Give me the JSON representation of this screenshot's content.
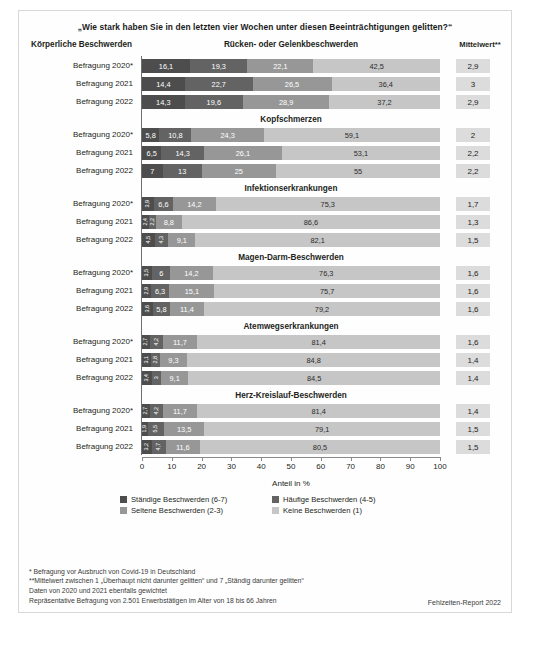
{
  "title": "„Wie stark haben Sie in den letzten vier Wochen unter diesen Beeinträchtigungen gelitten?“",
  "header": {
    "left": "Körperliche Beschwerden",
    "mean_col": "Mittelwert**"
  },
  "axis": {
    "caption": "Anteil in %",
    "ticks": [
      0,
      10,
      20,
      30,
      40,
      50,
      60,
      70,
      80,
      90,
      100
    ],
    "min": 0,
    "max": 100
  },
  "legend": [
    {
      "label": "Ständige Beschwerden (6-7)",
      "color": "#4d4d4d"
    },
    {
      "label": "Häufige Beschwerden (4-5)",
      "color": "#636363"
    },
    {
      "label": "Seltene Beschwerden (2-3)",
      "color": "#979797"
    },
    {
      "label": "Keine Beschwerden (1)",
      "color": "#c6c6c6"
    }
  ],
  "notes": [
    "*  Befragung vor Ausbruch von Covid-19 in Deutschland",
    "**Mittelwert zwischen 1 „Überhaupt nicht darunter gelitten“ und 7 „Ständig darunter gelitten“",
    "Daten von 2020 und 2021 ebenfalls gewichtet",
    "Repräsentative Befragung von 2.501 Erwerbstätigen im Alter von 18 bis 66 Jahren"
  ],
  "source": "Fehlzeiten-Report 2022",
  "chart_data": {
    "type": "bar",
    "orientation": "horizontal",
    "stacked": true,
    "percent": true,
    "title": "„Wie stark haben Sie in den letzten vier Wochen unter diesen Beeinträchtigungen gelitten?“",
    "xlabel": "Anteil in %",
    "ylabel": "Körperliche Beschwerden",
    "xlim": [
      0,
      100
    ],
    "grid": false,
    "legend_position": "bottom",
    "series": [
      {
        "name": "Ständige Beschwerden (6-7)",
        "color": "#4d4d4d"
      },
      {
        "name": "Häufige Beschwerden (4-5)",
        "color": "#636363"
      },
      {
        "name": "Seltene Beschwerden (2-3)",
        "color": "#979797"
      },
      {
        "name": "Keine Beschwerden (1)",
        "color": "#c6c6c6"
      }
    ],
    "groups": [
      {
        "name": "Rücken- oder Gelenkbeschwerden",
        "rows": [
          {
            "category": "Befragung 2020*",
            "values": [
              16.1,
              19.3,
              22.1,
              42.5
            ],
            "labels": [
              "16,1",
              "19,3",
              "22,1",
              "42,5"
            ],
            "mean": "2,9"
          },
          {
            "category": "Befragung 2021",
            "values": [
              14.4,
              22.7,
              26.5,
              36.4
            ],
            "labels": [
              "14,4",
              "22,7",
              "26,5",
              "36,4"
            ],
            "mean": "3"
          },
          {
            "category": "Befragung 2022",
            "values": [
              14.3,
              19.6,
              28.9,
              37.2
            ],
            "labels": [
              "14,3",
              "19,6",
              "28,9",
              "37,2"
            ],
            "mean": "2,9"
          }
        ]
      },
      {
        "name": "Kopfschmerzen",
        "rows": [
          {
            "category": "Befragung 2020*",
            "values": [
              5.8,
              10.8,
              24.3,
              59.1
            ],
            "labels": [
              "5,8",
              "10,8",
              "24,3",
              "59,1"
            ],
            "mean": "2"
          },
          {
            "category": "Befragung 2021",
            "values": [
              6.5,
              14.3,
              26.1,
              53.1
            ],
            "labels": [
              "6,5",
              "14,3",
              "26,1",
              "53,1"
            ],
            "mean": "2,2"
          },
          {
            "category": "Befragung 2022",
            "values": [
              7,
              13,
              25,
              55
            ],
            "labels": [
              "7",
              "13",
              "25",
              "55"
            ],
            "mean": "2,2"
          }
        ]
      },
      {
        "name": "Infektionserkrankungen",
        "rows": [
          {
            "category": "Befragung 2020*",
            "values": [
              3.9,
              6.6,
              14.2,
              75.3
            ],
            "labels": [
              "3,9",
              "6,6",
              "14,2",
              "75,3"
            ],
            "mean": "1,7"
          },
          {
            "category": "Befragung 2021",
            "values": [
              2.4,
              2.2,
              8.8,
              86.6
            ],
            "labels": [
              "2,4",
              "2,2",
              "8,8",
              "86,6"
            ],
            "mean": "1,3"
          },
          {
            "category": "Befragung 2022",
            "values": [
              4.5,
              4.3,
              9.1,
              82.1
            ],
            "labels": [
              "4,5",
              "4,3",
              "9,1",
              "82,1"
            ],
            "mean": "1,5"
          }
        ]
      },
      {
        "name": "Magen-Darm-Beschwerden",
        "rows": [
          {
            "category": "Befragung 2020*",
            "values": [
              3.5,
              6,
              14.2,
              76.3
            ],
            "labels": [
              "3,5",
              "6",
              "14,2",
              "76,3"
            ],
            "mean": "1,6"
          },
          {
            "category": "Befragung 2021",
            "values": [
              2.9,
              6.3,
              15.1,
              75.7
            ],
            "labels": [
              "2,9",
              "6,3",
              "15,1",
              "75,7"
            ],
            "mean": "1,6"
          },
          {
            "category": "Befragung 2022",
            "values": [
              3.6,
              5.8,
              11.4,
              79.2
            ],
            "labels": [
              "3,6",
              "5,8",
              "11,4",
              "79,2"
            ],
            "mean": "1,6"
          }
        ]
      },
      {
        "name": "Atemwegserkrankungen",
        "rows": [
          {
            "category": "Befragung 2020*",
            "values": [
              2.7,
              4.2,
              11.7,
              81.4
            ],
            "labels": [
              "2,7",
              "4,2",
              "11,7",
              "81,4"
            ],
            "mean": "1,6"
          },
          {
            "category": "Befragung 2021",
            "values": [
              3.1,
              2.8,
              9.3,
              84.8
            ],
            "labels": [
              "3,1",
              "2,8",
              "9,3",
              "84,8"
            ],
            "mean": "1,4"
          },
          {
            "category": "Befragung 2022",
            "values": [
              3.4,
              3,
              9.1,
              84.5
            ],
            "labels": [
              "3,4",
              "3",
              "9,1",
              "84,5"
            ],
            "mean": "1,4"
          }
        ]
      },
      {
        "name": "Herz-Kreislauf-Beschwerden",
        "rows": [
          {
            "category": "Befragung 2020*",
            "values": [
              2.7,
              4.2,
              11.7,
              81.4
            ],
            "labels": [
              "2,7",
              "4,2",
              "11,7",
              "81,4"
            ],
            "mean": "1,4"
          },
          {
            "category": "Befragung 2021",
            "values": [
              1.9,
              5.5,
              13.5,
              79.1
            ],
            "labels": [
              "1,9",
              "5,5",
              "13,5",
              "79,1"
            ],
            "mean": "1,5"
          },
          {
            "category": "Befragung 2022",
            "values": [
              3.2,
              4.7,
              11.6,
              80.5
            ],
            "labels": [
              "3,2",
              "4,7",
              "11,6",
              "80,5"
            ],
            "mean": "1,5"
          }
        ]
      }
    ]
  }
}
